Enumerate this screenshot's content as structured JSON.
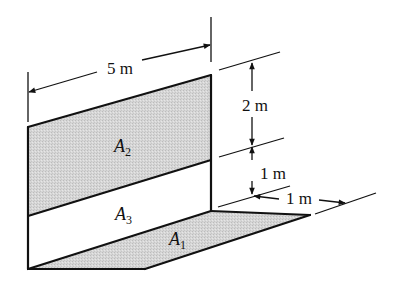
{
  "diagram": {
    "type": "3D wall/floor area figure with dimensions",
    "colors": {
      "line": "#111111",
      "shaded_fill": "#d4d4d4",
      "background": "#ffffff"
    },
    "areas": [
      {
        "id": "A1",
        "letter": "A",
        "subscript": "1",
        "shaded": true,
        "surface": "floor"
      },
      {
        "id": "A2",
        "letter": "A",
        "subscript": "2",
        "shaded": true,
        "surface": "wall-upper"
      },
      {
        "id": "A3",
        "letter": "A",
        "subscript": "3",
        "shaded": false,
        "surface": "wall-lower"
      }
    ],
    "dimensions": [
      {
        "id": "length",
        "label": "5 m"
      },
      {
        "id": "upper-height",
        "label": "2 m"
      },
      {
        "id": "lower-height",
        "label": "1 m"
      },
      {
        "id": "floor-depth",
        "label": "1 m"
      }
    ]
  }
}
